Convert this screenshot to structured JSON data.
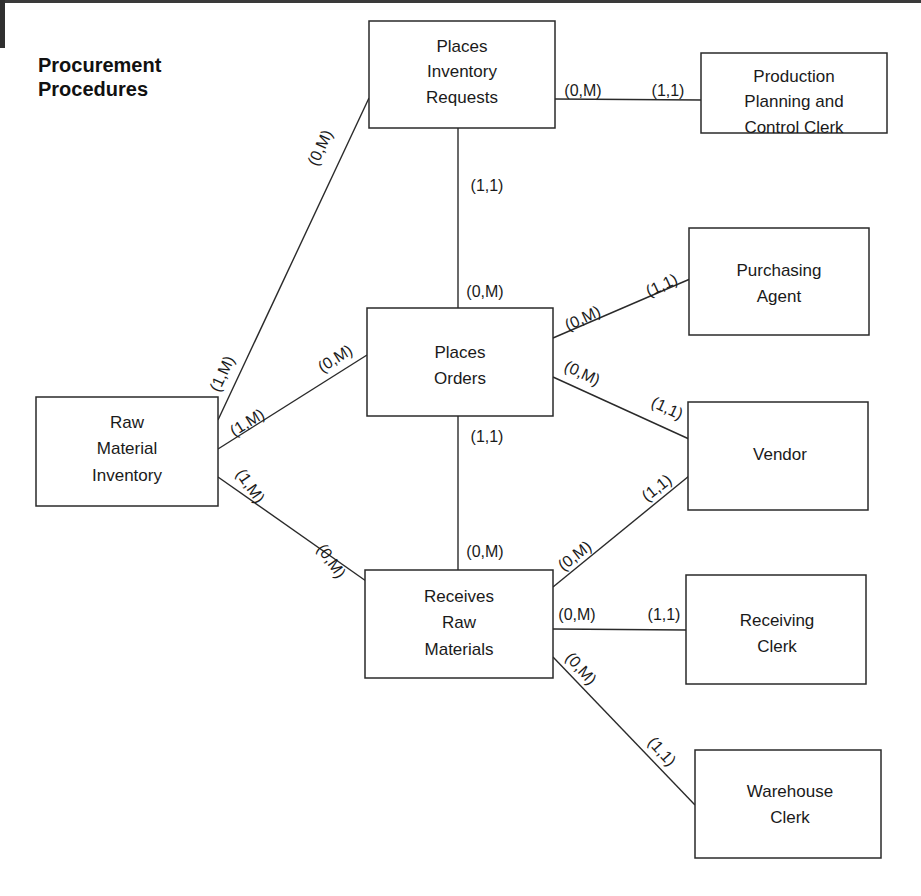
{
  "title": {
    "lines": [
      "Procurement",
      "Procedures"
    ]
  },
  "entities": {
    "places_inventory_requests": {
      "lines": [
        "Places",
        "Inventory",
        "Requests"
      ]
    },
    "production_clerk": {
      "lines": [
        "Production",
        "Planning and",
        "Control Clerk"
      ]
    },
    "purchasing_agent": {
      "lines": [
        "Purchasing",
        "Agent"
      ]
    },
    "places_orders": {
      "lines": [
        "Places",
        "Orders"
      ]
    },
    "raw_material_inventory": {
      "lines": [
        "Raw",
        "Material",
        "Inventory"
      ]
    },
    "vendor": {
      "lines": [
        "Vendor"
      ]
    },
    "receives_raw_materials": {
      "lines": [
        "Receives",
        "Raw",
        "Materials"
      ]
    },
    "receiving_clerk": {
      "lines": [
        "Receiving",
        "Clerk"
      ]
    },
    "warehouse_clerk": {
      "lines": [
        "Warehouse",
        "Clerk"
      ]
    }
  },
  "relationships": {
    "pir_production": {
      "from": "Places Inventory Requests",
      "to": "Production Planning and Control Clerk",
      "from_card": "(0,M)",
      "to_card": "(1,1)"
    },
    "pir_orders": {
      "from": "Places Inventory Requests",
      "to": "Places Orders",
      "from_card": "(1,1)",
      "to_card": "(0,M)"
    },
    "rmi_pir": {
      "from": "Raw Material Inventory",
      "to": "Places Inventory Requests",
      "from_card": "(1,M)",
      "to_card": "(0,M)"
    },
    "rmi_orders": {
      "from": "Raw Material Inventory",
      "to": "Places Orders",
      "from_card": "(1,M)",
      "to_card": "(0,M)"
    },
    "rmi_receives": {
      "from": "Raw Material Inventory",
      "to": "Receives Raw Materials",
      "from_card": "(1,M)",
      "to_card": "(0,M)"
    },
    "orders_purchasing": {
      "from": "Places Orders",
      "to": "Purchasing Agent",
      "from_card": "(0,M)",
      "to_card": "(1,1)"
    },
    "orders_vendor": {
      "from": "Places Orders",
      "to": "Vendor",
      "from_card": "(0,M)",
      "to_card": "(1,1)"
    },
    "orders_receives": {
      "from": "Places Orders",
      "to": "Receives Raw Materials",
      "from_card": "(1,1)",
      "to_card": "(0,M)"
    },
    "receives_vendor": {
      "from": "Receives Raw Materials",
      "to": "Vendor",
      "from_card": "(0,M)",
      "to_card": "(1,1)"
    },
    "receives_receiving": {
      "from": "Receives Raw Materials",
      "to": "Receiving Clerk",
      "from_card": "(0,M)",
      "to_card": "(1,1)"
    },
    "receives_warehouse": {
      "from": "Receives Raw Materials",
      "to": "Warehouse Clerk",
      "from_card": "(0,M)",
      "to_card": "(1,1)"
    }
  }
}
